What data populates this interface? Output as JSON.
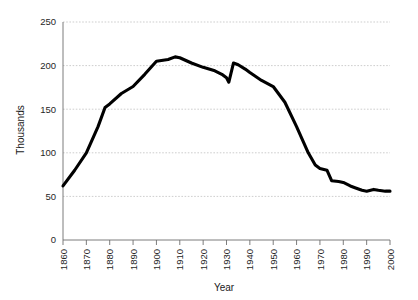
{
  "chart_data": {
    "type": "line",
    "title": "",
    "subtitle": "",
    "xlabel": "Year",
    "ylabel": "Thousands",
    "xlim": [
      1860,
      2000
    ],
    "ylim": [
      0,
      250
    ],
    "grid": true,
    "legend": false,
    "legend_position": "none",
    "x_tick_labels": [
      "1860",
      "1870",
      "1880",
      "1890",
      "1900",
      "1910",
      "1920",
      "1930",
      "1940",
      "1950",
      "1960",
      "1970",
      "1980",
      "1990",
      "2000"
    ],
    "x_ticks": [
      1860,
      1870,
      1880,
      1890,
      1900,
      1910,
      1920,
      1930,
      1940,
      1950,
      1960,
      1970,
      1980,
      1990,
      2000
    ],
    "y_tick_labels": [
      "0",
      "50",
      "100",
      "150",
      "200",
      "250"
    ],
    "y_ticks": [
      0,
      50,
      100,
      150,
      200,
      250
    ],
    "line_color": "#000000",
    "series": [
      {
        "name": "Thousands",
        "x": [
          1860,
          1865,
          1870,
          1875,
          1878,
          1880,
          1885,
          1890,
          1895,
          1900,
          1905,
          1908,
          1910,
          1915,
          1920,
          1925,
          1928,
          1930,
          1931,
          1933,
          1935,
          1938,
          1940,
          1945,
          1950,
          1955,
          1960,
          1963,
          1965,
          1968,
          1970,
          1973,
          1975,
          1978,
          1980,
          1983,
          1985,
          1988,
          1990,
          1993,
          1995,
          1998,
          2000
        ],
        "values": [
          62,
          80,
          100,
          130,
          152,
          156,
          168,
          176,
          190,
          205,
          207,
          210,
          209,
          203,
          198,
          194,
          190,
          186,
          181,
          203,
          201,
          196,
          192,
          183,
          176,
          158,
          130,
          112,
          100,
          86,
          82,
          80,
          68,
          67,
          66,
          62,
          60,
          57,
          56,
          58,
          57,
          56,
          56
        ]
      }
    ]
  },
  "axes": {
    "y_axis_title": "Thousands",
    "x_axis_title": "Year"
  }
}
